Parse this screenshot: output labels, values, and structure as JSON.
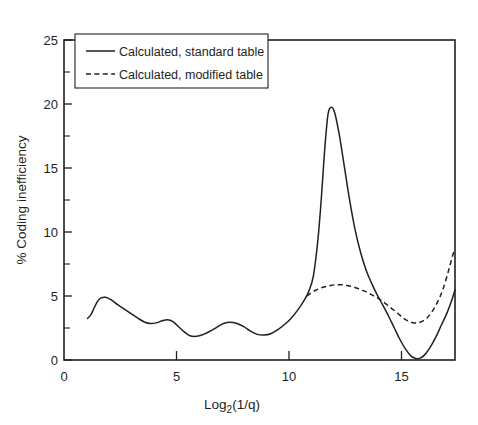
{
  "chart_data": {
    "type": "line",
    "title": "",
    "xlabel": "Log2(1/q)",
    "xlabel_base": "Log",
    "xlabel_sub": "2",
    "xlabel_tail": "(1/q)",
    "ylabel": "% Coding inefficiency",
    "xlim": [
      0,
      17.4
    ],
    "ylim": [
      0,
      25
    ],
    "xticks": [
      0,
      5,
      10,
      15
    ],
    "xtick_labels": [
      "0",
      "5",
      "10",
      "15"
    ],
    "yticks": [
      0,
      5,
      10,
      15,
      20,
      25
    ],
    "ytick_labels": [
      "0",
      "5",
      "10",
      "15",
      "20",
      "25"
    ],
    "y_minor_ticks": [
      2.5,
      7.5,
      12.5,
      17.5,
      22.5
    ],
    "grid": false,
    "legend_position": "top-left",
    "series": [
      {
        "name": "Calculated, standard table",
        "style": "solid",
        "color": "#231f20",
        "x": [
          1.05,
          1.2,
          1.35,
          1.5,
          1.65,
          1.85,
          2.1,
          2.4,
          2.7,
          3.0,
          3.3,
          3.6,
          3.85,
          4.1,
          4.35,
          4.6,
          4.85,
          5.1,
          5.35,
          5.6,
          5.9,
          6.2,
          6.5,
          6.8,
          7.1,
          7.4,
          7.7,
          8.0,
          8.3,
          8.6,
          8.9,
          9.2,
          9.5,
          9.8,
          10.1,
          10.4,
          10.7,
          10.9,
          11.1,
          11.3,
          11.45,
          11.6,
          11.75,
          11.9,
          12.05,
          12.25,
          12.45,
          12.7,
          12.95,
          13.2,
          13.45,
          13.7,
          13.95,
          14.2,
          14.45,
          14.7,
          14.95,
          15.2,
          15.45,
          15.65,
          15.85,
          16.05,
          16.3,
          16.55,
          16.8,
          17.05,
          17.3,
          17.4
        ],
        "y": [
          3.25,
          3.55,
          4.1,
          4.6,
          4.85,
          4.9,
          4.7,
          4.3,
          3.95,
          3.6,
          3.25,
          2.95,
          2.85,
          2.9,
          3.05,
          3.15,
          3.0,
          2.6,
          2.2,
          1.9,
          1.85,
          2.0,
          2.25,
          2.55,
          2.85,
          2.95,
          2.85,
          2.6,
          2.25,
          2.0,
          1.95,
          2.05,
          2.35,
          2.75,
          3.25,
          3.9,
          4.7,
          5.4,
          6.6,
          9.4,
          12.6,
          16.4,
          19.2,
          19.75,
          19.3,
          17.6,
          15.4,
          12.6,
          10.2,
          8.4,
          7.0,
          5.95,
          5.05,
          4.25,
          3.4,
          2.5,
          1.6,
          0.85,
          0.3,
          0.12,
          0.15,
          0.4,
          1.0,
          1.8,
          2.75,
          3.7,
          4.9,
          5.5
        ]
      },
      {
        "name": "Calculated, modified table",
        "style": "dashed",
        "color": "#231f20",
        "x": [
          10.8,
          11.0,
          11.2,
          11.4,
          11.6,
          11.85,
          12.1,
          12.35,
          12.6,
          12.85,
          13.1,
          13.35,
          13.6,
          13.85,
          14.1,
          14.35,
          14.6,
          14.85,
          15.1,
          15.35,
          15.6,
          15.85,
          16.1,
          16.35,
          16.6,
          16.85,
          17.1,
          17.3,
          17.4
        ],
        "y": [
          5.0,
          5.25,
          5.45,
          5.6,
          5.72,
          5.82,
          5.88,
          5.88,
          5.82,
          5.72,
          5.58,
          5.4,
          5.18,
          4.95,
          4.68,
          4.35,
          4.0,
          3.65,
          3.28,
          3.02,
          2.9,
          2.95,
          3.2,
          3.7,
          4.45,
          5.45,
          6.9,
          8.2,
          8.6
        ]
      }
    ]
  },
  "legend": {
    "items": [
      {
        "label": "Calculated, standard table",
        "style": "solid"
      },
      {
        "label": "Calculated, modified table",
        "style": "dashed"
      }
    ]
  }
}
